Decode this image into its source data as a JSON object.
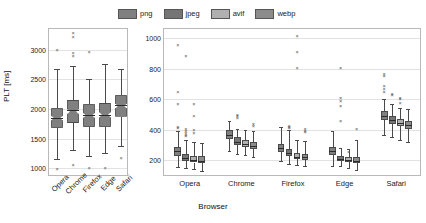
{
  "legend": {
    "position": "top-center",
    "items": [
      {
        "label": "png",
        "color": "#808080"
      },
      {
        "label": "jpeg",
        "color": "#757575"
      },
      {
        "label": "avif",
        "color": "#b0b0b0"
      },
      {
        "label": "webp",
        "color": "#8c8c8c"
      }
    ]
  },
  "chart_data": [
    {
      "type": "box",
      "id": "left-panel",
      "title": "",
      "xlabel": "",
      "ylabel": "PLT [ms]",
      "ylim": [
        850,
        3350
      ],
      "yticks": [
        1000,
        1500,
        2000,
        2500,
        3000
      ],
      "grid": true,
      "categories": [
        "Opera",
        "Chrome",
        "Firefox",
        "Edge",
        "Safari"
      ],
      "notched": true,
      "boxes": [
        {
          "category": "Opera",
          "min": 1150,
          "q1": 1680,
          "median": 1840,
          "q3": 2010,
          "max": 2670,
          "outliers": [
            2980,
            975
          ]
        },
        {
          "category": "Chrome",
          "min": 1310,
          "q1": 1760,
          "median": 1990,
          "q3": 2150,
          "max": 2730,
          "outliers": [
            3270,
            3200,
            2930,
            2870,
            1030
          ]
        },
        {
          "category": "Firefox",
          "min": 1200,
          "q1": 1700,
          "median": 1900,
          "q3": 2080,
          "max": 2510,
          "outliers": [
            2950,
            985
          ]
        },
        {
          "category": "Edge",
          "min": 1250,
          "q1": 1700,
          "median": 1900,
          "q3": 2100,
          "max": 2760,
          "outliers": [
            990
          ]
        },
        {
          "category": "Safari",
          "min": 1370,
          "q1": 1870,
          "median": 2060,
          "q3": 2230,
          "max": 2680,
          "outliers": [
            1160
          ]
        }
      ]
    },
    {
      "type": "box",
      "id": "right-panel",
      "title": "",
      "xlabel": "Browser",
      "ylabel": "",
      "ylim": [
        90,
        1060
      ],
      "yticks": [
        200,
        400,
        600,
        800,
        1000
      ],
      "grid": true,
      "categories": [
        "Opera",
        "Chrome",
        "Firefox",
        "Edge",
        "Safari"
      ],
      "series": [
        "png",
        "jpeg",
        "avif",
        "webp"
      ],
      "boxes": [
        {
          "category": "Opera",
          "series": "png",
          "min": 155,
          "q1": 230,
          "median": 258,
          "q3": 285,
          "max": 390,
          "outliers": [
            950,
            640,
            560,
            410,
            405
          ]
        },
        {
          "category": "Opera",
          "series": "jpeg",
          "min": 150,
          "q1": 196,
          "median": 215,
          "q3": 238,
          "max": 330,
          "outliers": [
            875,
            395,
            385,
            375,
            360,
            350
          ]
        },
        {
          "category": "Opera",
          "series": "avif",
          "min": 140,
          "q1": 185,
          "median": 200,
          "q3": 228,
          "max": 320,
          "outliers": [
            560,
            480,
            390,
            370
          ]
        },
        {
          "category": "Opera",
          "series": "webp",
          "min": 130,
          "q1": 180,
          "median": 198,
          "q3": 225,
          "max": 315,
          "outliers": []
        }
      ],
      "groups": [
        {
          "category": "Chrome",
          "boxes": [
            {
              "series": "png",
              "min": 262,
              "q1": 340,
              "median": 368,
              "q3": 395,
              "max": 455,
              "outliers": []
            },
            {
              "series": "jpeg",
              "min": 240,
              "q1": 300,
              "median": 322,
              "q3": 350,
              "max": 405,
              "outliers": [
                490,
                480,
                470
              ]
            },
            {
              "series": "avif",
              "min": 232,
              "q1": 288,
              "median": 305,
              "q3": 332,
              "max": 400,
              "outliers": []
            },
            {
              "series": "webp",
              "min": 222,
              "q1": 275,
              "median": 296,
              "q3": 322,
              "max": 390,
              "outliers": [
                430,
                420
              ]
            }
          ]
        },
        {
          "category": "Firefox",
          "boxes": [
            {
              "series": "png",
              "min": 195,
              "q1": 255,
              "median": 278,
              "q3": 305,
              "max": 415,
              "outliers": []
            },
            {
              "series": "jpeg",
              "min": 178,
              "q1": 228,
              "median": 248,
              "q3": 272,
              "max": 400,
              "outliers": [
                420,
                412,
                405
              ]
            },
            {
              "series": "avif",
              "min": 168,
              "q1": 205,
              "median": 222,
              "q3": 245,
              "max": 330,
              "outliers": [
                1010,
                905,
                800
              ]
            },
            {
              "series": "webp",
              "min": 160,
              "q1": 200,
              "median": 218,
              "q3": 240,
              "max": 325,
              "outliers": [
                395,
                385,
                378
              ]
            }
          ]
        },
        {
          "category": "Edge",
          "boxes": [
            {
              "series": "png",
              "min": 165,
              "q1": 232,
              "median": 258,
              "q3": 285,
              "max": 390,
              "outliers": []
            },
            {
              "series": "jpeg",
              "min": 160,
              "q1": 196,
              "median": 210,
              "q3": 228,
              "max": 280,
              "outliers": [
                800,
                598,
                580,
                548,
                450
              ]
            },
            {
              "series": "avif",
              "min": 150,
              "q1": 186,
              "median": 200,
              "q3": 222,
              "max": 275,
              "outliers": [
                250
              ]
            },
            {
              "series": "webp",
              "min": 135,
              "q1": 180,
              "median": 196,
              "q3": 222,
              "max": 330,
              "outliers": [
                400
              ]
            }
          ]
        },
        {
          "category": "Safari",
          "boxes": [
            {
              "series": "png",
              "min": 368,
              "q1": 465,
              "median": 492,
              "q3": 520,
              "max": 600,
              "outliers": [
                760,
                745,
                680,
                660,
                640
              ]
            },
            {
              "series": "jpeg",
              "min": 352,
              "q1": 440,
              "median": 462,
              "q3": 492,
              "max": 570,
              "outliers": [
                625,
                618
              ]
            },
            {
              "series": "avif",
              "min": 330,
              "q1": 422,
              "median": 442,
              "q3": 468,
              "max": 545,
              "outliers": [
                600,
                592,
                570
              ]
            },
            {
              "series": "webp",
              "min": 318,
              "q1": 405,
              "median": 428,
              "q3": 455,
              "max": 535,
              "outliers": []
            }
          ]
        }
      ]
    }
  ]
}
